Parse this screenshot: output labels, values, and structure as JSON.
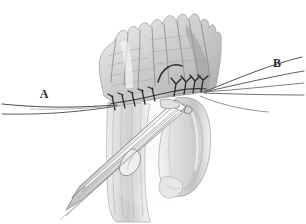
{
  "figure": {
    "medium": "grayscale pencil medical illustration",
    "background_color": "#ffffff",
    "width": 306,
    "height": 224
  },
  "labels": [
    {
      "id": "A",
      "text": "A",
      "x": 44,
      "y": 98,
      "description": "traction suture label, left side"
    },
    {
      "id": "B",
      "text": "B",
      "x": 277,
      "y": 67,
      "description": "traction suture label, right side"
    }
  ],
  "colors": {
    "ink_dark": "#2b2b2b",
    "ink_mid": "#5a5a5a",
    "ink_light": "#9a9a9a",
    "tissue_light": "#e8e8e8",
    "tissue_mid": "#c9c9c9",
    "tissue_dark": "#a6a6a6",
    "tissue_shadow": "#8a8a8a",
    "thread": "#4a4a4a",
    "instrument_edge": "#6e6e6e",
    "paper": "#ffffff"
  },
  "anatomy": {
    "upper_tissue": {
      "name": "upper-tissue-mass",
      "description": "irregular frond-like shaded tissue mass occupying upper center of the image"
    },
    "lower_tube": {
      "name": "tubular-structure",
      "description": "vertical tubular conduit descending from anastomosis toward bottom"
    },
    "anastomosis_line": {
      "name": "anastomosis-suture-line",
      "description": "horizontal sutured junction crossing mid-image"
    }
  },
  "sutures": {
    "count_left": 5,
    "count_right": 4,
    "left_stitch_x": [
      113,
      124,
      134,
      144,
      154
    ],
    "left_stitch_y": 101,
    "right_knot_x": [
      176,
      186,
      195,
      203
    ],
    "right_knot_y": 89,
    "description": "interrupted stitches along the anastomosis, knots shown as small Y/T marks"
  },
  "threads": {
    "left_bundle": {
      "name": "traction-suture-A",
      "converge_x": 117,
      "converge_y": 105,
      "exit_x": 2,
      "exit_y_top": 103,
      "exit_y_bottom": 113
    },
    "right_bundle": {
      "name": "traction-suture-B",
      "converge_x": 204,
      "converge_y": 92,
      "exit_x": 304,
      "rays_y": [
        58,
        70,
        82,
        95,
        112
      ]
    }
  },
  "instrument": {
    "name": "surgical-forceps",
    "description": "long fine forceps entering from lower left, tip grasping tissue at the anastomosis",
    "tip_x": 186,
    "tip_y": 108,
    "handle_x": 72,
    "handle_y": 218
  }
}
